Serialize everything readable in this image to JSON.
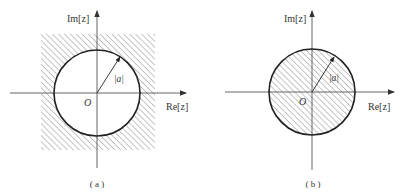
{
  "figure": {
    "colors": {
      "background": "#ffffff",
      "stroke": "#222222",
      "axis": "#555555",
      "hatch": "#8a8a8a",
      "text": "#333333"
    },
    "panels": [
      {
        "id": "a",
        "caption": "( a )",
        "imaginary_axis_label": "Im[z]",
        "real_axis_label": "Re[z]",
        "origin_label": "O",
        "radius_label": "|a|",
        "region": "exterior of circle |z| > |a| (hatched)",
        "circle": {
          "cx": 97,
          "cy": 93,
          "r": 43
        },
        "hatch_rect": {
          "x": 41,
          "y": 34,
          "w": 114,
          "h": 116
        }
      },
      {
        "id": "b",
        "caption": "( b )",
        "imaginary_axis_label": "Im[z]",
        "real_axis_label": "Re[z]",
        "origin_label": "O",
        "radius_label": "|a|",
        "region": "interior of circle |z| < |a| (hatched)",
        "circle": {
          "cx": 312,
          "cy": 92,
          "r": 43
        }
      }
    ]
  }
}
